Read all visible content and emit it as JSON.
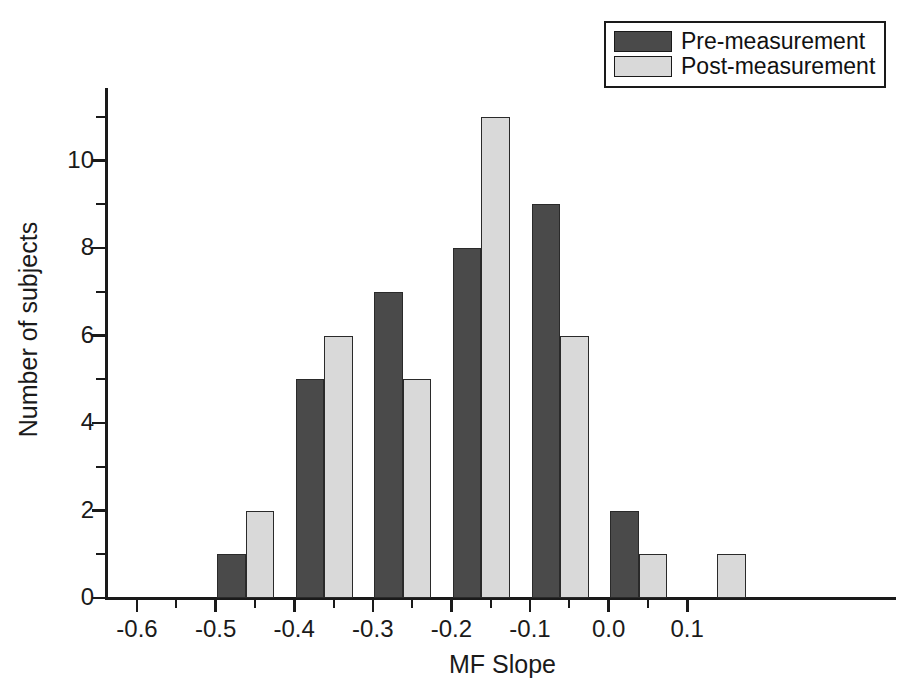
{
  "chart_data": {
    "type": "bar",
    "title": "",
    "xlabel": "MF Slope",
    "ylabel": "Number of subjects",
    "categories": [
      "-0.6",
      "-0.5",
      "-0.4",
      "-0.3",
      "-0.2",
      "-0.1",
      "0.0",
      "0.1"
    ],
    "series": [
      {
        "name": "Pre-measurement",
        "color": "#4a4a4a",
        "values": [
          0,
          1,
          5,
          7,
          8,
          9,
          2,
          0
        ]
      },
      {
        "name": "Post-measurement",
        "color": "#d9d9d9",
        "values": [
          0,
          2,
          6,
          5,
          11,
          6,
          1,
          1
        ]
      }
    ],
    "xlim": [
      -0.64,
      0.17
    ],
    "ylim": [
      0,
      11.65
    ],
    "y_ticks_major": [
      0,
      2,
      4,
      6,
      8,
      10
    ],
    "y_ticks_minor": [
      1,
      3,
      5,
      7,
      9,
      11
    ],
    "x_ticks_major": [
      -0.6,
      -0.5,
      -0.4,
      -0.3,
      -0.2,
      -0.1,
      0.0,
      0.1
    ],
    "x_ticks_minor": [
      -0.55,
      -0.45,
      -0.35,
      -0.25,
      -0.15,
      -0.05,
      0.05
    ],
    "grid": false,
    "legend_position": "top-right"
  },
  "legend": {
    "entries": [
      {
        "label": "Pre-measurement",
        "swatch": "dark-gray-swatch"
      },
      {
        "label": "Post-measurement",
        "swatch": "light-gray-swatch"
      }
    ]
  },
  "axes": {
    "y_title": "Number of subjects",
    "x_title": "MF Slope",
    "y_tick_labels": [
      "0",
      "2",
      "4",
      "6",
      "8",
      "10"
    ],
    "x_tick_labels": [
      "-0.6",
      "-0.5",
      "-0.4",
      "-0.3",
      "-0.2",
      "-0.1",
      "0.0",
      "0.1"
    ]
  }
}
